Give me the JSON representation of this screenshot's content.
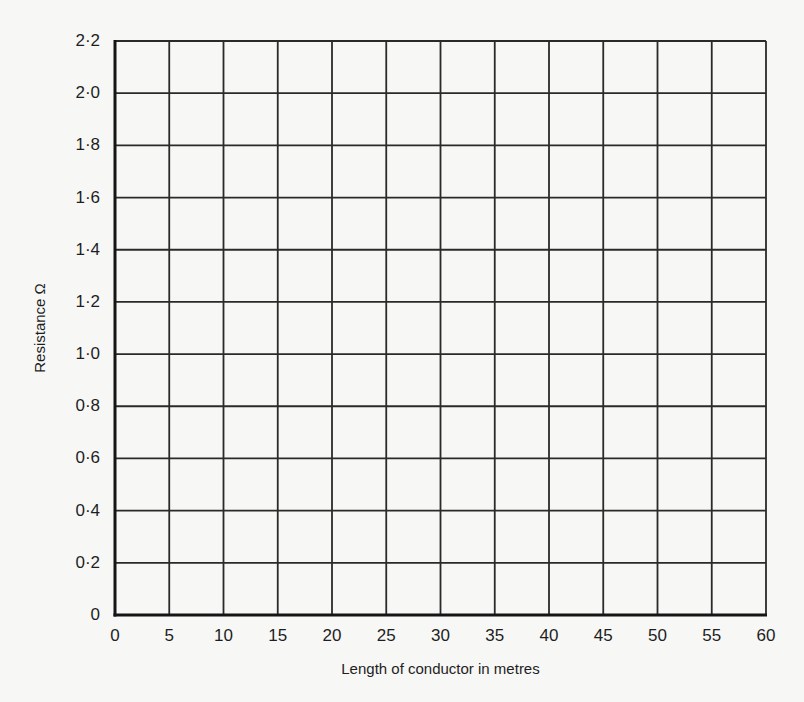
{
  "chart_data": {
    "type": "scatter",
    "title": "",
    "xlabel": "Length of conductor in metres",
    "ylabel": "Resistance Ω",
    "xlim": [
      0,
      60
    ],
    "ylim": [
      0,
      2.2
    ],
    "x_ticks": [
      "0",
      "5",
      "10",
      "15",
      "20",
      "25",
      "30",
      "35",
      "40",
      "45",
      "50",
      "55",
      "60"
    ],
    "y_ticks": [
      "0",
      "0·2",
      "0·4",
      "0·6",
      "0·8",
      "1·0",
      "1·2",
      "1·4",
      "1·6",
      "1·8",
      "2·0",
      "2·2"
    ],
    "x_tick_values": [
      0,
      5,
      10,
      15,
      20,
      25,
      30,
      35,
      40,
      45,
      50,
      55,
      60
    ],
    "y_tick_values": [
      0,
      0.2,
      0.4,
      0.6,
      0.8,
      1.0,
      1.2,
      1.4,
      1.6,
      1.8,
      2.0,
      2.2
    ],
    "grid": true,
    "series": [],
    "legend": null,
    "note": "Blank graph grid with no data plotted"
  },
  "colors": {
    "background": "#f7f7f6",
    "grid": "#2a2a2a",
    "axis": "#151515",
    "text": "#1e1e1e"
  }
}
